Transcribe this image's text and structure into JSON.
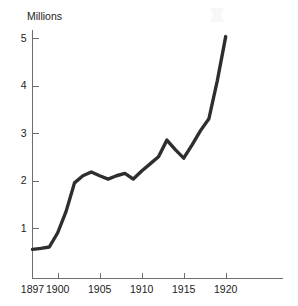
{
  "chart_data": {
    "type": "line",
    "title": "",
    "subtitle": "",
    "xlabel": "",
    "ylabel": "Millions",
    "xlim": [
      1897,
      1926
    ],
    "ylim": [
      0,
      5.4
    ],
    "grid": false,
    "legend": false,
    "legend_position": "none",
    "line_color": "#2e2e2e",
    "axis_color": "#6f6f6f",
    "text_color": "#1c1c1c",
    "background_color": "#ffffff",
    "x_ticks": [
      1897,
      1900,
      1905,
      1910,
      1915,
      1920
    ],
    "x_tick_labels": [
      "1897",
      "1900",
      "1905",
      "1910",
      "1915",
      "1920"
    ],
    "y_ticks": [
      1,
      2,
      3,
      4,
      5
    ],
    "y_tick_labels": [
      "1",
      "2",
      "3",
      "4",
      "5"
    ],
    "series": [
      {
        "name": "Millions",
        "x": [
          1897,
          1898,
          1899,
          1900,
          1901,
          1902,
          1903,
          1904,
          1905,
          1906,
          1907,
          1908,
          1909,
          1910,
          1911,
          1912,
          1913,
          1914,
          1915,
          1916,
          1917,
          1918,
          1919,
          1920
        ],
        "values": [
          0.55,
          0.57,
          0.6,
          0.9,
          1.35,
          1.95,
          2.1,
          2.18,
          2.1,
          2.03,
          2.1,
          2.15,
          2.03,
          2.2,
          2.35,
          2.5,
          2.85,
          2.65,
          2.47,
          2.75,
          3.05,
          3.3,
          4.1,
          5.03
        ]
      }
    ],
    "annotations": []
  },
  "axis": {
    "y_title": "Millions"
  }
}
